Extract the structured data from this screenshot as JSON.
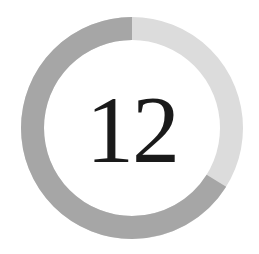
{
  "progress": {
    "value": "12",
    "filled_percent": 66,
    "colors": {
      "filled": "#a6a6a6",
      "track": "#dcdcdc",
      "text": "#1a1a1a",
      "background": "#ffffff"
    }
  }
}
